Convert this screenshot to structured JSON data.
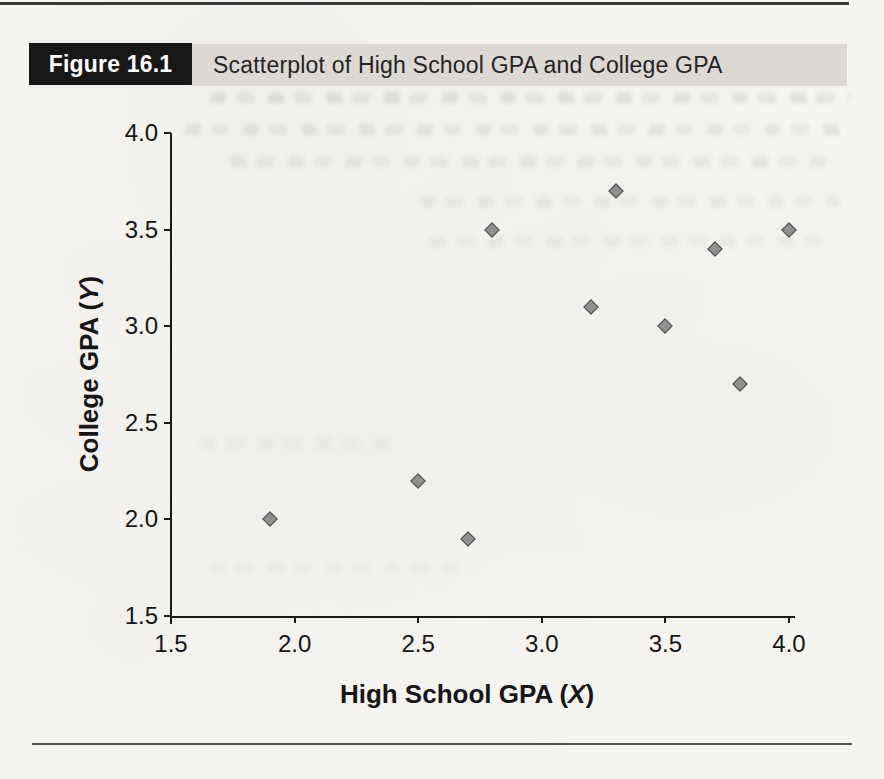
{
  "page": {
    "background_color": "#f6f5f2",
    "top_rule_color": "#3b3b3b",
    "bottom_rule_color": "#555555"
  },
  "figure_header": {
    "figure_label": "Figure 16.1",
    "title": "Scatterplot of High School GPA and College GPA",
    "label_bg_color": "#171717",
    "label_text_color": "#ffffff",
    "title_band_color": "#dcd9d5"
  },
  "axes": {
    "x_label_prefix": "High School GPA (",
    "x_label_var": "X",
    "x_label_suffix": ")",
    "y_label_prefix": "College GPA (",
    "y_label_var": "Y",
    "y_label_suffix": ")",
    "x_tick_labels": [
      "1.5",
      "2.0",
      "2.5",
      "3.0",
      "3.5",
      "4.0"
    ],
    "y_tick_labels": [
      "1.5",
      "2.0",
      "2.5",
      "3.0",
      "3.5",
      "4.0"
    ],
    "axis_color": "#1a1a1a"
  },
  "chart_data": {
    "type": "scatter",
    "title": "Scatterplot of High School GPA and College GPA",
    "xlabel": "High School GPA (X)",
    "ylabel": "College GPA (Y)",
    "xlim": [
      1.5,
      4.0
    ],
    "ylim": [
      1.5,
      4.0
    ],
    "x_ticks": [
      1.5,
      2.0,
      2.5,
      3.0,
      3.5,
      4.0
    ],
    "y_ticks": [
      1.5,
      2.0,
      2.5,
      3.0,
      3.5,
      4.0
    ],
    "grid": false,
    "legend": false,
    "marker": "diamond",
    "marker_fill": "#909090",
    "marker_stroke": "#4a4a4a",
    "points": [
      {
        "x": 1.9,
        "y": 2.0
      },
      {
        "x": 2.5,
        "y": 2.2
      },
      {
        "x": 2.7,
        "y": 1.9
      },
      {
        "x": 2.8,
        "y": 3.5
      },
      {
        "x": 3.2,
        "y": 3.1
      },
      {
        "x": 3.3,
        "y": 3.7
      },
      {
        "x": 3.5,
        "y": 3.0
      },
      {
        "x": 3.7,
        "y": 3.4
      },
      {
        "x": 3.8,
        "y": 2.7
      },
      {
        "x": 4.0,
        "y": 3.5
      }
    ]
  }
}
